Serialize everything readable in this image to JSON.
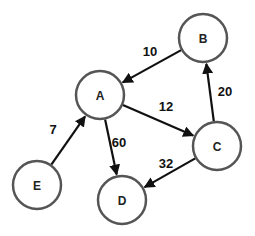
{
  "graph": {
    "type": "directed-weighted",
    "node_radius": 24,
    "nodes": [
      {
        "id": "A",
        "label": "A",
        "x": 100,
        "y": 95
      },
      {
        "id": "B",
        "label": "B",
        "x": 203,
        "y": 38
      },
      {
        "id": "C",
        "label": "C",
        "x": 217,
        "y": 146
      },
      {
        "id": "D",
        "label": "D",
        "x": 122,
        "y": 200
      },
      {
        "id": "E",
        "label": "E",
        "x": 37,
        "y": 185
      }
    ],
    "edges": [
      {
        "from": "B",
        "to": "A",
        "weight": "10",
        "label_x": 150,
        "label_y": 51
      },
      {
        "from": "A",
        "to": "C",
        "weight": "12",
        "label_x": 166,
        "label_y": 106
      },
      {
        "from": "C",
        "to": "B",
        "weight": "20",
        "label_x": 225,
        "label_y": 91
      },
      {
        "from": "A",
        "to": "D",
        "weight": "60",
        "label_x": 119,
        "label_y": 142
      },
      {
        "from": "C",
        "to": "D",
        "weight": "32",
        "label_x": 166,
        "label_y": 163
      },
      {
        "from": "E",
        "to": "A",
        "weight": "7",
        "label_x": 53,
        "label_y": 129
      }
    ]
  }
}
